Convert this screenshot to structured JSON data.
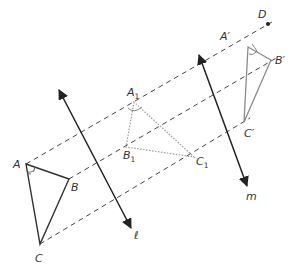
{
  "diagram": {
    "type": "geometric-transformation",
    "colors": {
      "original_triangle": "#333333",
      "intermediate_triangle": "#9a9a9a",
      "image_triangle": "#8c8c8c",
      "mirror_lines": "#222222",
      "dashed_lines": "#444444",
      "labels": "#333333"
    },
    "points": {
      "A": {
        "label": "A",
        "sub": "",
        "prime": "",
        "x": 26,
        "y": 164
      },
      "B": {
        "label": "B",
        "sub": "",
        "prime": "",
        "x": 69,
        "y": 179
      },
      "C": {
        "label": "C",
        "sub": "",
        "prime": "",
        "x": 40,
        "y": 244
      },
      "A1": {
        "label": "A",
        "sub": "1",
        "prime": "",
        "x": 134,
        "y": 102
      },
      "B1": {
        "label": "B",
        "sub": "1",
        "prime": "",
        "x": 126,
        "y": 147
      },
      "C1": {
        "label": "C",
        "sub": "1",
        "prime": "",
        "x": 194,
        "y": 157
      },
      "Ap": {
        "label": "A",
        "sub": "",
        "prime": "′",
        "x": 248,
        "y": 47
      },
      "Bp": {
        "label": "B",
        "sub": "",
        "prime": "′",
        "x": 271,
        "y": 60
      },
      "Cp": {
        "label": "C",
        "sub": "",
        "prime": "′",
        "x": 244,
        "y": 122
      },
      "D": {
        "label": "D",
        "sub": "",
        "prime": "",
        "x": 268,
        "y": 24
      }
    },
    "lines": {
      "l": {
        "label": "ℓ",
        "x1": 59,
        "y1": 90,
        "x2": 131,
        "y2": 228
      },
      "m": {
        "label": "m",
        "x1": 199,
        "y1": 55,
        "x2": 247,
        "y2": 186
      }
    },
    "triangles": [
      {
        "name": "ABC",
        "style": "solid"
      },
      {
        "name": "A1B1C1",
        "style": "dotted"
      },
      {
        "name": "A'B'C'",
        "style": "solid-gray"
      }
    ],
    "angle_marks": [
      "A",
      "A1",
      "A'"
    ]
  }
}
